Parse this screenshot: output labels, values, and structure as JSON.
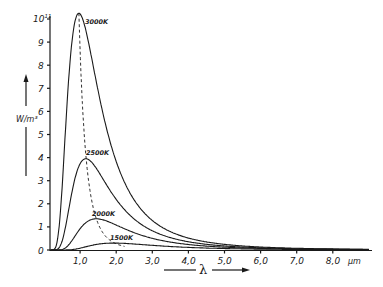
{
  "chart_data": {
    "type": "line",
    "title": "",
    "xlabel": "λ",
    "x_unit": "μm",
    "ylabel": "W/m³",
    "y_top_label": "10¹¹",
    "xlim": [
      0,
      9.0
    ],
    "ylim": [
      0,
      10.3
    ],
    "x_ticks": [
      1.0,
      2.0,
      3.0,
      4.0,
      5.0,
      6.0,
      7.0,
      8.0
    ],
    "x_tick_labels": [
      "1,0",
      "2,0",
      "3,0",
      "4,0",
      "5,0",
      "6,0",
      "7,0",
      "8,0"
    ],
    "y_ticks": [
      0,
      1,
      2,
      3,
      4,
      5,
      6,
      7,
      8,
      9,
      10
    ],
    "y_tick_labels": [
      "0",
      "1",
      "2",
      "3",
      "4",
      "5",
      "6",
      "7",
      "8",
      "9",
      "10¹¹"
    ],
    "grid": false,
    "legend": "inline curve labels",
    "series": [
      {
        "name": "3000K",
        "temperature_K": 3000,
        "peak_lambda_um": 0.97,
        "peak_value": 10.25
      },
      {
        "name": "2500K",
        "temperature_K": 2500,
        "peak_lambda_um": 1.16,
        "peak_value": 3.95
      },
      {
        "name": "2000K",
        "temperature_K": 2000,
        "peak_lambda_um": 1.45,
        "peak_value": 1.35
      },
      {
        "name": "1500K",
        "temperature_K": 1500,
        "peak_lambda_um": 1.93,
        "peak_value": 0.3
      }
    ],
    "annotations": [
      "dashed line connecting curve maxima (Wien displacement)"
    ]
  },
  "labels": {
    "y_unit": "W/m³",
    "x_unit": "μm",
    "x_symbol": "λ",
    "curve_3000": "3000K",
    "curve_2500": "2500K",
    "curve_2000": "2000K",
    "curve_1500": "1500K"
  }
}
